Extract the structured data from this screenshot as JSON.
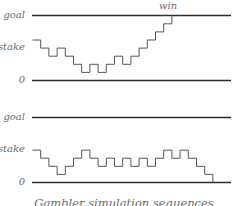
{
  "diagram": {
    "caption": "Gambler simulation sequences",
    "colors": {
      "axis": "#2e2e2e",
      "walk": "#555555",
      "label": "#6b6b6b",
      "background": "#ffffff"
    },
    "panels": [
      {
        "labels": {
          "goal": "goal",
          "stake": "stake",
          "zero": "0"
        },
        "end_annotation": "win",
        "goal_level": 8,
        "stake_level": 5,
        "levels": [
          5,
          4,
          3,
          4,
          3,
          2,
          1,
          2,
          1,
          2,
          3,
          2,
          3,
          4,
          5,
          6,
          7,
          8
        ],
        "outcome": "win"
      },
      {
        "labels": {
          "goal": "goal",
          "stake": "stake",
          "zero": "0"
        },
        "end_annotation": "",
        "goal_level": 8,
        "stake_level": 4,
        "levels": [
          4,
          3,
          2,
          1,
          2,
          3,
          4,
          3,
          2,
          3,
          2,
          3,
          2,
          3,
          2,
          3,
          4,
          3,
          4,
          3,
          2,
          1,
          0
        ],
        "outcome": "lose"
      }
    ]
  }
}
